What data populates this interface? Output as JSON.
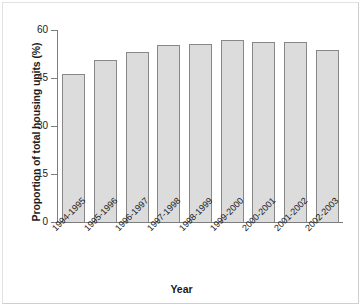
{
  "chart_data": {
    "type": "bar",
    "title": "",
    "xlabel": "Year",
    "ylabel": "Proportion of total housing units (%)",
    "categories": [
      "1994-1995",
      "1995-1996",
      "1996-1997",
      "1997-1998",
      "1998-1999",
      "1999-2000",
      "2000-2001",
      "2001-2002",
      "2002-2003"
    ],
    "values": [
      46.3,
      50.6,
      53.1,
      55.3,
      55.6,
      57.0,
      56.2,
      56.2,
      53.8
    ],
    "ylim": [
      0,
      60
    ],
    "yticks": [
      0,
      15,
      30,
      45,
      60
    ],
    "ytick_labels": [
      "0",
      "15",
      "30",
      "45",
      "60"
    ],
    "grid": false,
    "legend": null,
    "bar_fill_color": "#dcdcdc",
    "bar_edge_color": "#888888",
    "axis_color": "#7d7d7d",
    "background_color": "#ffffff",
    "xtick_label_rotation": -45
  }
}
